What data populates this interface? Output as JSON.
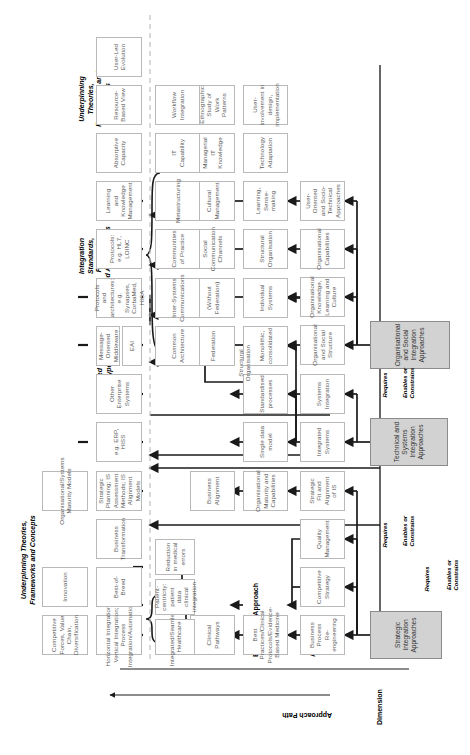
{
  "diagram": {
    "column_headers": [
      {
        "id": "dimension",
        "label": "Dimension"
      },
      {
        "id": "approach",
        "label": "Approach"
      },
      {
        "id": "elements",
        "label": "Elements of Approach"
      },
      {
        "id": "approach-path",
        "label": "Approach Path"
      }
    ],
    "right_headers": [
      {
        "id": "underpinning-top",
        "line1": "Underpinning Theories,",
        "line2": "Frameworks and Concepts"
      },
      {
        "id": "integrated-systems-types",
        "line1": "Integrated",
        "line2": "Systems Types"
      },
      {
        "id": "integration-standards",
        "line1": "Integration",
        "line2": "Standards,",
        "line3": "Protocols",
        "line4": "and Architectures"
      },
      {
        "id": "underpinning-bottom",
        "line1": "Underpinning",
        "line2": "Theories,",
        "line3": "Frameworks and",
        "line4": "Concepts"
      }
    ],
    "dimensions": [
      {
        "id": "strategic",
        "label": "Strategic Integration Approaches"
      },
      {
        "id": "technical",
        "label": "Technical and Systems Integration Approaches"
      },
      {
        "id": "organisational",
        "label": "Organisational and Social Integration Approaches"
      }
    ],
    "relations": [
      {
        "id": "requires-1",
        "label": "Requires"
      },
      {
        "id": "enables-constrains-1",
        "line1": "Enables or",
        "line2": "Constrains"
      },
      {
        "id": "requires-2",
        "label": "Requires"
      },
      {
        "id": "requires-3",
        "label": "Requires"
      },
      {
        "id": "enables-constrains-2",
        "line1": "Enables or",
        "line2": "Constrains"
      },
      {
        "id": "enables-constrains-3",
        "line1": "Enables or",
        "line2": "Constrains"
      }
    ],
    "approach_boxes": [
      {
        "id": "bpr",
        "label": "Business Process Re-engineering"
      },
      {
        "id": "competitive-strategy",
        "label": "Competitive Strategy"
      },
      {
        "id": "quality-management",
        "label": "Quality Management"
      },
      {
        "id": "strategic-fit",
        "label": "Strategic Fit and Alignment of IS"
      },
      {
        "id": "integrated-systems",
        "label": "Integrated Systems"
      },
      {
        "id": "systems-integration",
        "label": "Systems Integration"
      },
      {
        "id": "org-social-structure",
        "label": "Organisational and Social Structure"
      },
      {
        "id": "org-knowledge",
        "label": "Organisational Knowledge, Learning and Culture"
      },
      {
        "id": "org-capabilities",
        "label": "Organisational Capabilities"
      },
      {
        "id": "user-oriented",
        "label": "User-Oriented and Socio-Technical Approaches"
      }
    ],
    "element_boxes": [
      {
        "id": "best-practices",
        "label": "Best Practices/Clinical Protocols/Evidence-Based Medicine"
      },
      {
        "id": "org-maturity",
        "label": "Organisational Maturity and Capabilities"
      },
      {
        "id": "single-data-model",
        "label": "Single data model"
      },
      {
        "id": "standardised-processes",
        "label": "Standardised processes"
      },
      {
        "id": "monolithic",
        "label": "Monolithic, consolidated"
      },
      {
        "id": "individual-systems",
        "label": "Individual Systems"
      },
      {
        "id": "structural-organisation",
        "label": "Structural Organisation"
      },
      {
        "id": "learning-sensemaking",
        "label": "Learning, Sense-making"
      },
      {
        "id": "technology-adaptation",
        "label": "Technology Adaptation"
      },
      {
        "id": "user-involvement",
        "label": "User-involvement in design, implementation"
      }
    ],
    "path_boxes": [
      {
        "id": "clinical-pathways",
        "label": "Clinical Pathways"
      },
      {
        "id": "business-alignment",
        "label": "Business Alignment"
      },
      {
        "id": "federation",
        "label": "Federation"
      },
      {
        "id": "without-federation",
        "label": "(Without Federation)"
      },
      {
        "id": "social-comm-channels",
        "label": "Social Communication Channels"
      },
      {
        "id": "cultural-management",
        "label": "Cultural Management"
      },
      {
        "id": "managerial-it-knowledge",
        "label": "Managerial IT Knowledge"
      },
      {
        "id": "ethnographic-study",
        "label": "Ethnographic Study of Work Patterns"
      }
    ],
    "outcome_boxes": [
      {
        "id": "integrated-seamless",
        "label": "Integrated/Seamless Healthcare"
      },
      {
        "id": "patient-centricity",
        "label": "Patient-centricity: patient data clinical integration"
      },
      {
        "id": "reduction-errors",
        "label": "Reduction in medical errors"
      },
      {
        "id": "common-architecture",
        "label": "Common Architecture"
      },
      {
        "id": "inter-systems-comms",
        "label": "Inter-Systems Communications"
      },
      {
        "id": "communities-practice",
        "label": "Communities of Practice"
      },
      {
        "id": "metastructuring",
        "label": "Metastructuring"
      },
      {
        "id": "it-capability",
        "label": "IT Capability"
      },
      {
        "id": "workflow-integration",
        "label": "Workflow Integration"
      }
    ],
    "theory_boxes": [
      {
        "id": "competitive-forces",
        "label": "Competitive Forces, Value Chain, Diversification"
      },
      {
        "id": "innovation",
        "label": "Innovation"
      },
      {
        "id": "horizontal-integration",
        "label": "Horizontal Integration; Vertical Integration; Process Integration/Automation"
      },
      {
        "id": "best-of-breed",
        "label": "Best-of-Breed"
      },
      {
        "id": "business-transformation",
        "label": "Business Transformation"
      },
      {
        "id": "org-systems-maturity",
        "label": "Organisational/Systems Maturity Models"
      },
      {
        "id": "strategic-planning",
        "label": "Strategic Planning; IS Assessment Methods; IS Alignment Models"
      },
      {
        "id": "erp-hiss",
        "label": "e.g. ERP, HISS"
      },
      {
        "id": "other-enterprise",
        "label": "Other Enterprise Systems"
      },
      {
        "id": "eai",
        "label": "EAI"
      },
      {
        "id": "message-oriented",
        "label": "Message-Oriented Middleware"
      },
      {
        "id": "protocols-architectures",
        "label": "Protocols and architectures: e.g. Synapses, CorbaMed, HISA"
      },
      {
        "id": "protocols-hl7",
        "label": "Protocols: e.g. HL7, LOINC"
      },
      {
        "id": "learning-knowledge-mgmt",
        "label": "Learning and Knowledge Management"
      },
      {
        "id": "absorptive-capacity",
        "label": "Absorptive Capacity"
      },
      {
        "id": "resource-based-view",
        "label": "Resource-Based View"
      },
      {
        "id": "user-led-evolution",
        "label": "User-Led Evolution"
      }
    ]
  }
}
